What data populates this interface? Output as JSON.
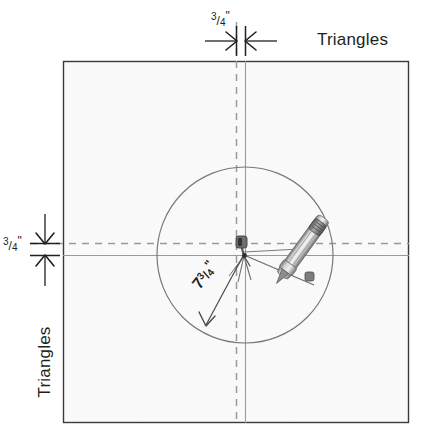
{
  "diagram": {
    "labels": {
      "triangles_top": "Triangles",
      "triangles_left": "Triangles"
    },
    "dimensions": {
      "top": {
        "whole": "",
        "numerator": "3",
        "slash": "/",
        "denominator": "4",
        "unit": "\"",
        "text": "3/4\""
      },
      "left": {
        "whole": "",
        "numerator": "3",
        "slash": "/",
        "denominator": "4",
        "unit": "\"",
        "text": "3/4\""
      },
      "radius": {
        "whole": "7",
        "numerator": "3",
        "slash": "/",
        "denominator": "4",
        "unit": "\"",
        "text": "7 3/4\""
      }
    },
    "colors": {
      "paper": "#fbfbfb",
      "frame_border": "#3a3a3a",
      "ink": "#231f20",
      "construction_line": "#8c8c8c",
      "dashed_line": "#8c8c8c",
      "circle": "#707070",
      "tool_metal": "#9a9a9a",
      "tool_dark": "#585858"
    },
    "geometry": {
      "frame": {
        "x": 63,
        "y": 61,
        "width": 346,
        "height": 362
      },
      "circle": {
        "cx": 245,
        "cy": 255,
        "r": 88
      },
      "solid_vertical_x": 245,
      "solid_horizontal_y": 255,
      "dashed_vertical_x": 236,
      "dashed_horizontal_y": 243,
      "radius_arrow_end": {
        "x": 205,
        "y": 326
      },
      "compass_pencil_tip": {
        "x": 317,
        "y": 287
      }
    },
    "icons": {
      "compass": "drafting-compass-icon",
      "arrow": "dimension-arrow-icon"
    }
  }
}
